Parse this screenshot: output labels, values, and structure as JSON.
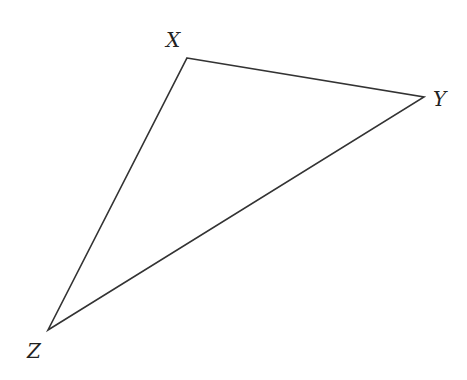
{
  "diagram": {
    "type": "triangle",
    "stroke_color": "#333333",
    "stroke_width": 1.6,
    "vertices": [
      {
        "name": "X",
        "x": 187,
        "y": 58,
        "label": "X",
        "label_x": 166,
        "label_y": 47
      },
      {
        "name": "Y",
        "x": 424,
        "y": 97,
        "label": "Y",
        "label_x": 433,
        "label_y": 106
      },
      {
        "name": "Z",
        "x": 48,
        "y": 330,
        "label": "Z",
        "label_x": 27,
        "label_y": 358
      }
    ],
    "edges": [
      {
        "from": "X",
        "to": "Y"
      },
      {
        "from": "Y",
        "to": "Z"
      },
      {
        "from": "Z",
        "to": "X"
      }
    ]
  }
}
